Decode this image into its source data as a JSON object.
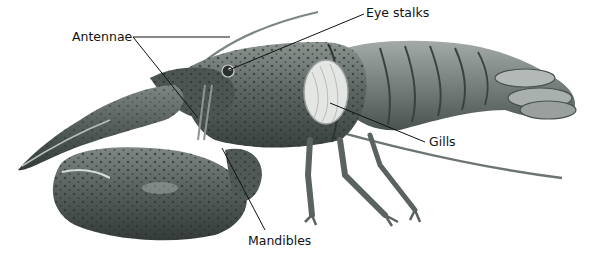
{
  "diagram": {
    "labels": [
      {
        "id": "antennae",
        "text": "Antennae",
        "x": 72,
        "y": 32
      },
      {
        "id": "eye-stalks",
        "text": "Eye stalks",
        "x": 366,
        "y": 8
      },
      {
        "id": "gills",
        "text": "Gills",
        "x": 429,
        "y": 137
      },
      {
        "id": "mandibles",
        "text": "Mandibles",
        "x": 248,
        "y": 236
      }
    ],
    "colors": {
      "background": "#ffffff",
      "body_dark": "#3f4a46",
      "body_mid": "#6b7470",
      "body_light": "#9aa19e",
      "gills": "#e4e6e4",
      "spots": "#2a302e",
      "leader_line": "#111111"
    }
  }
}
